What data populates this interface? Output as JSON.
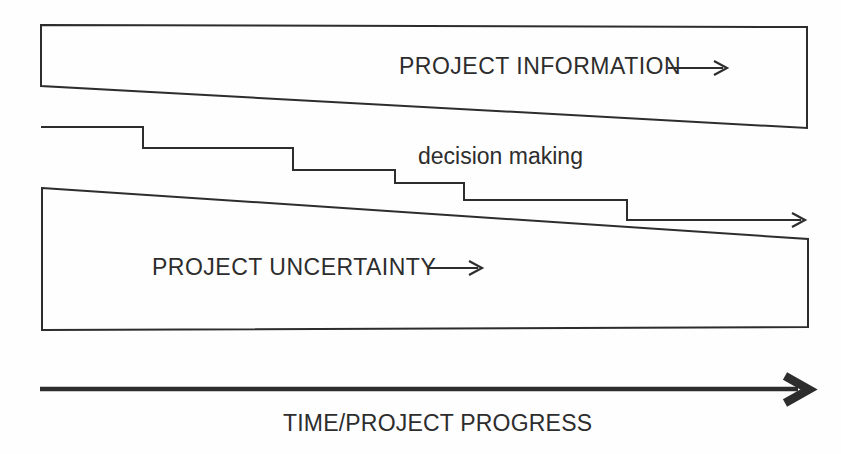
{
  "colors": {
    "line": "#2d2d2d",
    "text": "#2d2d2d",
    "background": "#fefefe"
  },
  "diagram": {
    "information_band": {
      "label": "PROJECT INFORMATION",
      "arrow_icon": "right-arrow"
    },
    "decision_steps": {
      "label": "decision making",
      "arrow_icon": "right-arrow"
    },
    "uncertainty_band": {
      "label": "PROJECT UNCERTAINTY",
      "arrow_icon": "right-arrow"
    },
    "time_axis": {
      "label": "TIME/PROJECT PROGRESS",
      "arrow_icon": "right-arrow-bold"
    }
  }
}
